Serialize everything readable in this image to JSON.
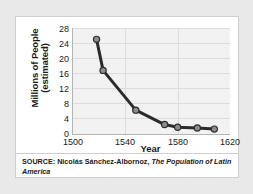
{
  "card": {
    "source_prefix": "SOURCE:",
    "source_author": "Nicolás Sánchez-Albornoz,",
    "source_title": "The Population of Latin America"
  },
  "chart_data": {
    "type": "line",
    "title": "",
    "xlabel": "Year",
    "ylabel_line1": "Millions of People",
    "ylabel_line2": "(estimated)",
    "xlim": [
      1500,
      1620
    ],
    "ylim": [
      0,
      28
    ],
    "xticks": [
      "1500",
      "1540",
      "1580",
      "1620"
    ],
    "xtick_values": [
      1500,
      1540,
      1580,
      1620
    ],
    "yticks": [
      "0",
      "4",
      "8",
      "12",
      "16",
      "20",
      "24",
      "28"
    ],
    "ytick_values": [
      0,
      4,
      8,
      12,
      16,
      20,
      24,
      28
    ],
    "grid": true,
    "legend": "none",
    "series": [
      {
        "name": "Population of Latin America (estimated)",
        "x": [
          1518,
          1523,
          1548,
          1570,
          1580,
          1595,
          1608
        ],
        "values": [
          25.0,
          16.8,
          6.3,
          2.5,
          1.8,
          1.6,
          1.3
        ],
        "line_color": "#2b2b2b",
        "marker_color": "#8c8c8c",
        "marker_edge_color": "#2b2b2b"
      }
    ]
  },
  "colors": {
    "page_background": "#e9e9e9",
    "card_background": "#ffffff",
    "card_border": "#cfcfcf",
    "plot_background": "#f2f2f2",
    "gridline": "#dcdcdc",
    "axis": "#b4b4b4",
    "text": "#1a1a1a"
  }
}
